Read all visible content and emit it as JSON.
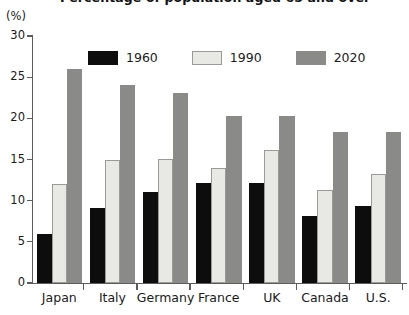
{
  "title_partial": "Percentage of population aged 65 and over",
  "unit_label": "(%)",
  "legend": {
    "items": [
      {
        "label": "1960",
        "color": "#0d0d0d",
        "swatch_name": "legend-swatch-1960"
      },
      {
        "label": "1990",
        "color": "#e8e8e5",
        "swatch_name": "legend-swatch-1990"
      },
      {
        "label": "2020",
        "color": "#8a8a88",
        "swatch_name": "legend-swatch-2020"
      }
    ]
  },
  "chart_data": {
    "type": "bar",
    "title": "Percentage of population aged 65 and over",
    "xlabel": "",
    "ylabel": "(%)",
    "ylim": [
      0,
      30
    ],
    "yticks": [
      0,
      5,
      10,
      15,
      20,
      25,
      30
    ],
    "ytick_labels": [
      "0",
      "5",
      "10",
      "15",
      "20",
      "25",
      "30"
    ],
    "grid": false,
    "legend_position": "top-center",
    "categories": [
      "Japan",
      "Italy",
      "Germany",
      "France",
      "UK",
      "Canada",
      "U.S."
    ],
    "series": [
      {
        "name": "1960",
        "color": "#0d0d0d",
        "values": [
          6.0,
          9.1,
          11.1,
          12.1,
          12.2,
          8.2,
          9.3
        ]
      },
      {
        "name": "1990",
        "color": "#e8e8e5",
        "values": [
          12.0,
          15.0,
          15.1,
          14.0,
          16.2,
          11.3,
          13.3
        ]
      },
      {
        "name": "2020",
        "color": "#8a8a88",
        "values": [
          26.0,
          24.1,
          23.1,
          20.3,
          20.3,
          18.3,
          18.4
        ]
      }
    ]
  }
}
